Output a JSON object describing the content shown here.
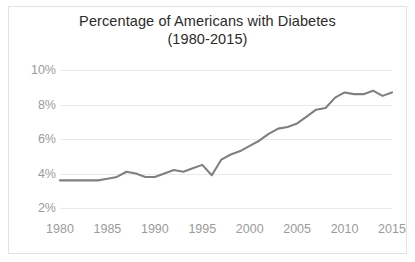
{
  "chart_data": {
    "type": "line",
    "title": "Percentage of Americans with Diabetes",
    "subtitle": "(1980-2015)",
    "title_line1": "Percentage of Americans with Diabetes",
    "title_line2": "(1980-2015)",
    "xlabel": "",
    "ylabel": "",
    "x": [
      1980,
      1981,
      1982,
      1983,
      1984,
      1985,
      1986,
      1987,
      1988,
      1989,
      1990,
      1991,
      1992,
      1993,
      1994,
      1995,
      1996,
      1997,
      1998,
      1999,
      2000,
      2001,
      2002,
      2003,
      2004,
      2005,
      2006,
      2007,
      2008,
      2009,
      2010,
      2011,
      2012,
      2013,
      2014,
      2015
    ],
    "values": [
      3.6,
      3.6,
      3.6,
      3.6,
      3.6,
      3.7,
      3.8,
      4.1,
      4.0,
      3.8,
      3.8,
      4.0,
      4.2,
      4.1,
      4.3,
      4.5,
      3.9,
      4.8,
      5.1,
      5.3,
      5.6,
      5.9,
      6.3,
      6.6,
      6.7,
      6.9,
      7.3,
      7.7,
      7.8,
      8.4,
      8.7,
      8.6,
      8.6,
      8.8,
      8.5,
      8.7
    ],
    "ylim": [
      2,
      10
    ],
    "xlim": [
      1980,
      2015
    ],
    "yticks": [
      2,
      4,
      6,
      8,
      10
    ],
    "ytick_labels": [
      "2%",
      "4%",
      "6%",
      "8%",
      "10%"
    ],
    "xticks": [
      1980,
      1985,
      1990,
      1995,
      2000,
      2005,
      2010,
      2015
    ],
    "xtick_labels": [
      "1980",
      "1985",
      "1990",
      "1995",
      "2000",
      "2005",
      "2010",
      "2015"
    ],
    "grid": true,
    "legend": false,
    "series_color": "#808080",
    "gridline_color": "#e9e9e9",
    "tick_label_color": "#9b9b9b",
    "title_color": "#2b2b2b",
    "border_color": "#e2e2e2",
    "background_color": "#ffffff"
  }
}
